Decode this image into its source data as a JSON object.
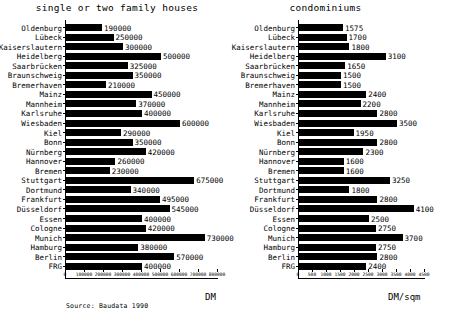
{
  "figure": {
    "source_note": "Source: Baudata 1990",
    "bar_color": "#000000"
  },
  "chart_data": [
    {
      "type": "bar",
      "orientation": "horizontal",
      "title": "single or two family houses",
      "xlabel": "DM",
      "ylabel": "",
      "xlim": [
        0,
        800000
      ],
      "grid": false,
      "legend": "none",
      "xticks": [
        0,
        100000,
        200000,
        300000,
        400000,
        500000,
        600000,
        700000,
        800000
      ],
      "xticklabels": [
        "0",
        "100000",
        "200000",
        "300000",
        "400000",
        "500000",
        "600000",
        "700000",
        "800000"
      ],
      "categories": [
        "Oldenburg",
        "Lübeck",
        "Kaiserslautern",
        "Heidelberg",
        "Saarbrücken",
        "Braunschweig",
        "Bremerhaven",
        "Mainz",
        "Mannheim",
        "Karlsruhe",
        "Wiesbaden",
        "Kiel",
        "Bonn",
        "Nürnberg",
        "Hannover",
        "Bremen",
        "Stuttgart",
        "Dortmund",
        "Frankfurt",
        "Düsseldorf",
        "Essen",
        "Cologne",
        "Munich",
        "Hamburg",
        "Berlin",
        "FRG"
      ],
      "values": [
        190000,
        250000,
        300000,
        500000,
        325000,
        350000,
        210000,
        450000,
        370000,
        400000,
        600000,
        290000,
        350000,
        420000,
        260000,
        230000,
        675000,
        340000,
        495000,
        545000,
        400000,
        420000,
        730000,
        380000,
        570000,
        400000
      ],
      "datalabels": [
        "190000",
        "250000",
        "300000",
        "500000",
        "325000",
        "350000",
        "210000",
        "450000",
        "370000",
        "400000",
        "600000",
        "290000",
        "350000",
        "420000",
        "260000",
        "230000",
        "675000",
        "340000",
        "495000",
        "545000",
        "400000",
        "420000",
        "730000",
        "380000",
        "570000",
        "400000"
      ]
    },
    {
      "type": "bar",
      "orientation": "horizontal",
      "title": "condominiums",
      "xlabel": "DM/sqm",
      "ylabel": "",
      "xlim": [
        0,
        4500
      ],
      "grid": false,
      "legend": "none",
      "xticks": [
        0,
        500,
        1000,
        1500,
        2000,
        2500,
        3000,
        3500,
        4000,
        4500
      ],
      "xticklabels": [
        "0",
        "500",
        "1000",
        "1500",
        "2000",
        "2500",
        "3000",
        "3500",
        "4000",
        "4500"
      ],
      "categories": [
        "Oldenburg",
        "Lübeck",
        "Kaiserslautern",
        "Heidelberg",
        "Saarbrücken",
        "Braunschweig",
        "Bremerhaven",
        "Mainz",
        "Mannheim",
        "Karlsruhe",
        "Wiesbaden",
        "Kiel",
        "Bonn",
        "Nürnberg",
        "Hannover",
        "Bremen",
        "Stuttgart",
        "Dortmund",
        "Frankfurt",
        "Düsseldorf",
        "Essen",
        "Cologne",
        "Munich",
        "Hamburg",
        "Berlin",
        "FRG"
      ],
      "values": [
        1575,
        1700,
        1800,
        3100,
        1650,
        1500,
        1500,
        2400,
        2200,
        2800,
        3500,
        1950,
        2800,
        2300,
        1600,
        1600,
        3250,
        1800,
        2800,
        4100,
        2500,
        2750,
        3700,
        2750,
        2800,
        2400
      ],
      "datalabels": [
        "1575",
        "1700",
        "1800",
        "3100",
        "1650",
        "1500",
        "1500",
        "2400",
        "2200",
        "2800",
        "3500",
        "1950",
        "2800",
        "2300",
        "1600",
        "1600",
        "3250",
        "1800",
        "2800",
        "4100",
        "2500",
        "2750",
        "3700",
        "2750",
        "2800",
        "2400"
      ]
    }
  ]
}
